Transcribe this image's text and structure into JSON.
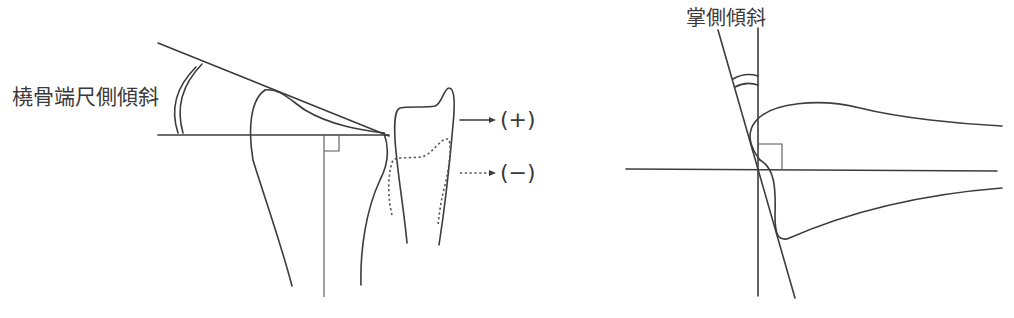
{
  "figure": {
    "left_panel": {
      "angle_label": "橈骨端尺側傾斜",
      "legend": [
        {
          "line_style": "solid",
          "icon": "solid-arrow-icon",
          "label": "(+)"
        },
        {
          "line_style": "dotted",
          "icon": "dotted-arrow-icon",
          "label": "(−)"
        }
      ]
    },
    "right_panel": {
      "angle_label": "掌側傾斜"
    },
    "colors": {
      "line": "#3c3c3c",
      "text": "#3a3a3a",
      "background": "#ffffff"
    }
  }
}
